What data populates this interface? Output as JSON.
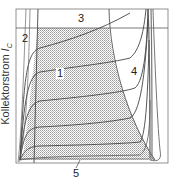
{
  "diagram": {
    "y_axis_label": "Kollektorstrom",
    "y_axis_symbol": "I",
    "y_axis_subscript": "C",
    "regions": [
      {
        "id": "1",
        "label": "1"
      },
      {
        "id": "2",
        "label": "2"
      },
      {
        "id": "3",
        "label": "3"
      },
      {
        "id": "4",
        "label": "4"
      },
      {
        "id": "5",
        "label": "5"
      }
    ],
    "colors": {
      "frame": "#777777",
      "curve": "#444444",
      "shading": "#c8c8c8"
    }
  }
}
